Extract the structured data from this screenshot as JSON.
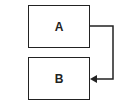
{
  "diagram": {
    "nodes": [
      {
        "id": "A",
        "label": "A"
      },
      {
        "id": "B",
        "label": "B"
      }
    ],
    "edges": [
      {
        "from": "A",
        "to": "B",
        "route": "right-side loop",
        "arrowhead": "at B"
      }
    ],
    "colors": {
      "stroke": "#222222",
      "background": "#ffffff"
    }
  }
}
